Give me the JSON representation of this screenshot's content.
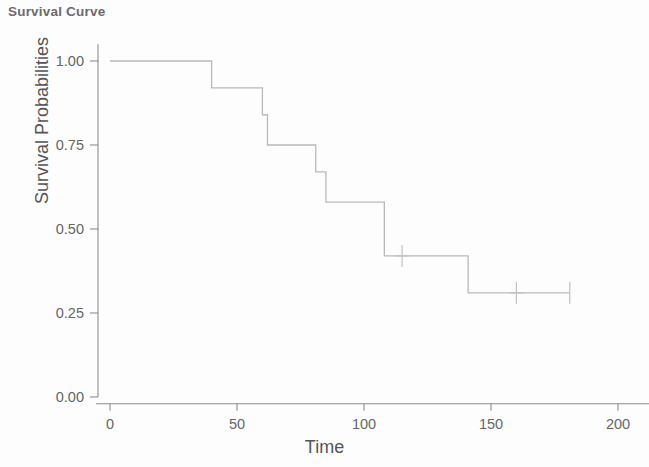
{
  "chart_data": {
    "type": "line",
    "subtype": "kaplan-meier-step",
    "title": "Survival Curve",
    "xlabel": "Time",
    "ylabel": "Survival Probabilities",
    "xlim": [
      -8,
      212
    ],
    "ylim": [
      0.0,
      1.05
    ],
    "grid": false,
    "legend": null,
    "x_ticks": [
      0,
      50,
      100,
      150,
      200
    ],
    "x_tick_labels": [
      "0",
      "50",
      "100",
      "150",
      "200"
    ],
    "y_ticks": [
      0.0,
      0.25,
      0.5,
      0.75,
      1.0
    ],
    "y_tick_labels": [
      "0.00",
      "0.25",
      "0.50",
      "0.75",
      "1.00"
    ],
    "line_color": "#b9b9b9",
    "axis_color": "#8d8d8d",
    "title_color": "#6b6b6b",
    "step_x": [
      0,
      40,
      40,
      60,
      60,
      62,
      62,
      81,
      81,
      85,
      85,
      108,
      108,
      141,
      141,
      181
    ],
    "step_y": [
      1.0,
      1.0,
      0.92,
      0.92,
      0.84,
      0.84,
      0.75,
      0.75,
      0.67,
      0.67,
      0.58,
      0.58,
      0.42,
      0.42,
      0.31,
      0.31
    ],
    "steps": [
      {
        "time": 0,
        "survival": 1.0
      },
      {
        "time": 40,
        "survival": 0.92
      },
      {
        "time": 60,
        "survival": 0.84
      },
      {
        "time": 62,
        "survival": 0.75
      },
      {
        "time": 81,
        "survival": 0.67
      },
      {
        "time": 85,
        "survival": 0.58
      },
      {
        "time": 108,
        "survival": 0.42
      },
      {
        "time": 141,
        "survival": 0.31
      },
      {
        "time": 181,
        "survival": 0.31
      }
    ],
    "censored": [
      {
        "time": 115,
        "survival": 0.42
      },
      {
        "time": 160,
        "survival": 0.31
      },
      {
        "time": 181,
        "survival": 0.31
      }
    ]
  },
  "chart": {
    "title": "Survival Curve",
    "xlabel": "Time",
    "ylabel": "Survival Probabilities"
  }
}
